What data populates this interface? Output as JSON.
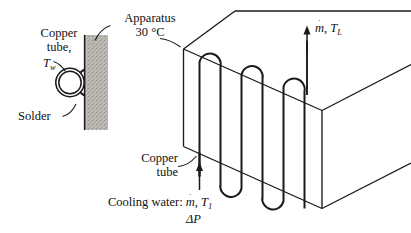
{
  "figure": {
    "background_color": "#ffffff",
    "line_color": "#1a1a1a",
    "wall_fill_color": "#b9b5ae"
  },
  "labels": {
    "copper_tube_left_line1": "Copper",
    "copper_tube_left_line2": "tube,",
    "wall_temperature_symbol": "T",
    "wall_temperature_subscript": "w",
    "solder": "Solder",
    "apparatus_line1": "Apparatus",
    "apparatus_line2": "30 °C",
    "copper_tube_coil_line1": "Copper",
    "copper_tube_coil_line2": "tube",
    "outlet_mass_flow_symbol": "m",
    "outlet_separator": ", ",
    "outlet_temperature_symbol": "T",
    "outlet_temperature_subscript": "L",
    "inlet_prefix": "Cooling water: ",
    "inlet_mass_flow_symbol": "m",
    "inlet_separator": ", ",
    "inlet_temperature_symbol": "T",
    "inlet_temperature_subscript": "1",
    "pressure_drop": "ΔP",
    "overdot": "˙"
  },
  "values": {
    "apparatus_temperature": "30 °C"
  },
  "icons": {
    "inlet_arrow": "arrow-up-icon",
    "outlet_arrow": "arrow-up-icon"
  }
}
